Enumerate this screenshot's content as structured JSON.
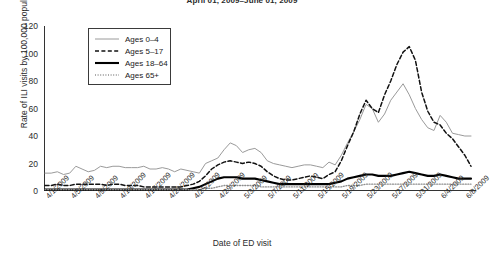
{
  "chart_data": {
    "type": "line",
    "title": "April 01, 2009–June 01, 2009",
    "xlabel": "Date of ED visit",
    "ylabel": "Rate of ILI visits by 100,000 population",
    "ylim": [
      0,
      120
    ],
    "yticks": [
      0,
      20,
      40,
      60,
      80,
      100,
      120
    ],
    "grid": false,
    "legend_position": "upper-left-inside",
    "x": [
      "4/1/2009",
      "4/2/2009",
      "4/3/2009",
      "4/4/2009",
      "4/5/2009",
      "4/6/2009",
      "4/7/2009",
      "4/8/2009",
      "4/9/2009",
      "4/10/2009",
      "4/11/2009",
      "4/12/2009",
      "4/13/2009",
      "4/14/2009",
      "4/15/2009",
      "4/16/2009",
      "4/17/2009",
      "4/18/2009",
      "4/19/2009",
      "4/20/2009",
      "4/21/2009",
      "4/22/2009",
      "4/23/2009",
      "4/24/2009",
      "4/25/2009",
      "4/26/2009",
      "4/27/2009",
      "4/28/2009",
      "4/29/2009",
      "4/30/2009",
      "5/1/2009",
      "5/2/2009",
      "5/3/2009",
      "5/4/2009",
      "5/5/2009",
      "5/6/2009",
      "5/7/2009",
      "5/8/2009",
      "5/9/2009",
      "5/10/2009",
      "5/11/2009",
      "5/12/2009",
      "5/13/2009",
      "5/14/2009",
      "5/15/2009",
      "5/16/2009",
      "5/17/2009",
      "5/18/2009",
      "5/19/2009",
      "5/20/2009",
      "5/21/2009",
      "5/22/2009",
      "5/23/2009",
      "5/24/2009",
      "5/25/2009",
      "5/26/2009",
      "5/27/2009",
      "5/28/2009",
      "5/29/2009",
      "5/30/2009",
      "5/31/2009",
      "6/1/2009",
      "6/2/2009",
      "6/3/2009",
      "6/4/2009",
      "6/5/2009",
      "6/6/2009",
      "6/7/2009",
      "6/8/2009",
      "6/9/2009"
    ],
    "xtick_labels": [
      "4/1/2009",
      "4/5/2009",
      "4/9/2009",
      "4/13/2009",
      "4/17/2009",
      "4/21/2009",
      "4/25/2009",
      "4/29/2009",
      "5/3/2009",
      "5/7/2009",
      "5/11/2009",
      "5/15/2009",
      "5/19/2009",
      "5/23/2009",
      "5/27/2009",
      "5/31/2009",
      "6/4/2009",
      "6/8/2009"
    ],
    "xtick_indices": [
      0,
      4,
      8,
      12,
      16,
      20,
      24,
      28,
      32,
      36,
      40,
      44,
      48,
      52,
      56,
      60,
      64,
      68
    ],
    "series": [
      {
        "name": "Ages 0–4",
        "style": "solid-thin",
        "color": "#9a9a9a",
        "values": [
          13,
          13,
          14,
          12,
          13,
          18,
          16,
          14,
          15,
          18,
          17,
          18,
          18,
          17,
          17,
          17,
          18,
          16,
          16,
          17,
          16,
          14,
          16,
          15,
          14,
          13,
          20,
          22,
          24,
          30,
          35,
          33,
          28,
          30,
          31,
          28,
          22,
          20,
          19,
          18,
          17,
          18,
          19,
          19,
          18,
          17,
          21,
          19,
          26,
          35,
          43,
          52,
          63,
          60,
          50,
          56,
          66,
          72,
          78,
          70,
          60,
          52,
          46,
          44,
          55,
          50,
          42,
          41,
          40,
          40
        ]
      },
      {
        "name": "Ages 5–17",
        "style": "dashed",
        "color": "#111111",
        "values": [
          4,
          4,
          5,
          4,
          4,
          5,
          5,
          5,
          5,
          5,
          4,
          5,
          5,
          4,
          4,
          4,
          3,
          3,
          3,
          3,
          3,
          3,
          3,
          4,
          5,
          7,
          11,
          16,
          19,
          21,
          22,
          21,
          20,
          21,
          20,
          18,
          14,
          11,
          9,
          8,
          8,
          9,
          10,
          11,
          10,
          9,
          12,
          14,
          22,
          33,
          43,
          56,
          66,
          60,
          57,
          70,
          80,
          92,
          101,
          105,
          95,
          72,
          58,
          50,
          48,
          42,
          38,
          32,
          26,
          18
        ]
      },
      {
        "name": "Ages 18–64",
        "style": "solid-thick",
        "color": "#000000",
        "values": [
          1,
          1,
          1,
          1,
          1,
          1,
          1,
          1,
          1,
          1,
          1,
          1,
          1,
          1,
          1,
          1,
          1,
          1,
          1,
          1,
          1,
          1,
          1,
          1,
          2,
          3,
          5,
          7,
          9,
          10,
          10,
          10,
          9,
          9,
          9,
          8,
          7,
          6,
          5,
          5,
          5,
          5,
          5,
          5,
          5,
          5,
          5,
          6,
          7,
          9,
          10,
          11,
          12,
          12,
          11,
          11,
          11,
          12,
          13,
          14,
          13,
          12,
          11,
          11,
          12,
          11,
          10,
          9,
          9,
          9
        ]
      },
      {
        "name": "Ages 65+",
        "style": "dotted",
        "color": "#8e8e8e",
        "values": [
          1,
          1,
          1,
          1,
          1,
          1,
          1,
          1,
          1,
          1,
          1,
          1,
          1,
          1,
          1,
          1,
          1,
          1,
          1,
          1,
          1,
          1,
          1,
          1,
          1,
          1,
          2,
          2,
          3,
          4,
          4,
          4,
          4,
          4,
          4,
          3,
          3,
          3,
          3,
          3,
          3,
          3,
          3,
          3,
          3,
          3,
          3,
          3,
          3,
          4,
          4,
          4,
          5,
          5,
          5,
          5,
          5,
          5,
          5,
          5,
          5,
          5,
          5,
          5,
          5,
          5,
          5,
          5,
          5,
          5
        ]
      }
    ]
  }
}
